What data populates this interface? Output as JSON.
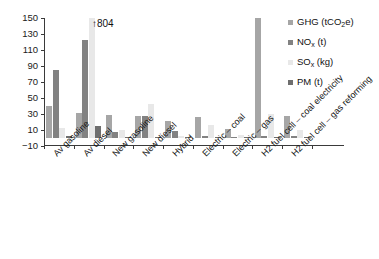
{
  "chart_data": {
    "type": "bar",
    "title": "",
    "subtitle": "",
    "xlabel": "",
    "ylabel": "",
    "ylim": [
      -10,
      150
    ],
    "yticks": [
      -10,
      10,
      30,
      50,
      70,
      90,
      110,
      130,
      150
    ],
    "grid": false,
    "legend_position": "right",
    "categories": [
      "Av gasoline",
      "Av diesel",
      "New gasoline",
      "New diesel",
      "Hybrid",
      "Electric – coal",
      "Electric – gas",
      "H2 fuel cell – coal electricity",
      "H2 fuel cell – gas reforming"
    ],
    "series": [
      {
        "name": "GHG (tCO2e)",
        "name_html": "GHG (tCO<sub>2</sub>e)",
        "color": "#a6a6a6",
        "values": [
          40,
          31,
          29,
          27,
          21,
          26,
          11,
          150,
          28
        ]
      },
      {
        "name": "NOx (t)",
        "name_html": "NO<sub>x</sub> (t)",
        "color": "#828282",
        "values": [
          85,
          122,
          8,
          27,
          9,
          2,
          1,
          2,
          2
        ]
      },
      {
        "name": "SOx (kg)",
        "name_html": "SO<sub>x</sub> (kg)",
        "color": "#e8e8e8",
        "values": [
          13,
          804,
          10,
          43,
          3,
          16,
          4,
          30,
          10
        ]
      },
      {
        "name": "PM (t)",
        "name_html": "PM (t)",
        "color": "#6e6e6e",
        "values": [
          2,
          15,
          0.5,
          0.5,
          0.3,
          0.3,
          0.2,
          0.3,
          0.3
        ]
      }
    ],
    "annotations": [
      {
        "text": "↑4804",
        "label": "804",
        "arrow": "↑",
        "target_category": "Av diesel",
        "target_series": "SOx (kg)",
        "note": "bar clipped at top of axis"
      }
    ]
  }
}
